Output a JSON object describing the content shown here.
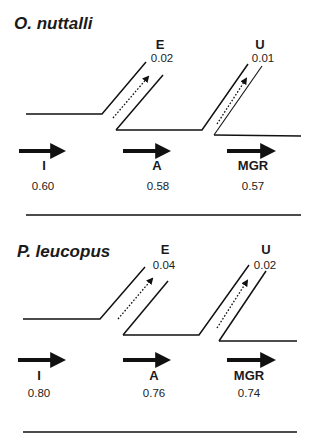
{
  "panels": [
    {
      "species": "O. nuttalli",
      "transitions": [
        {
          "label": "I",
          "value": "0.60"
        },
        {
          "label": "A",
          "value": "0.58"
        },
        {
          "label": "MGR",
          "value": "0.57"
        }
      ],
      "exits": [
        {
          "label": "E",
          "value": "0.02"
        },
        {
          "label": "U",
          "value": "0.01"
        }
      ]
    },
    {
      "species": "P. leucopus",
      "transitions": [
        {
          "label": "I",
          "value": "0.80"
        },
        {
          "label": "A",
          "value": "0.76"
        },
        {
          "label": "MGR",
          "value": "0.74"
        }
      ],
      "exits": [
        {
          "label": "E",
          "value": "0.04"
        },
        {
          "label": "U",
          "value": "0.02"
        }
      ]
    }
  ],
  "colors": {
    "line": "#111111",
    "background": "#ffffff"
  }
}
